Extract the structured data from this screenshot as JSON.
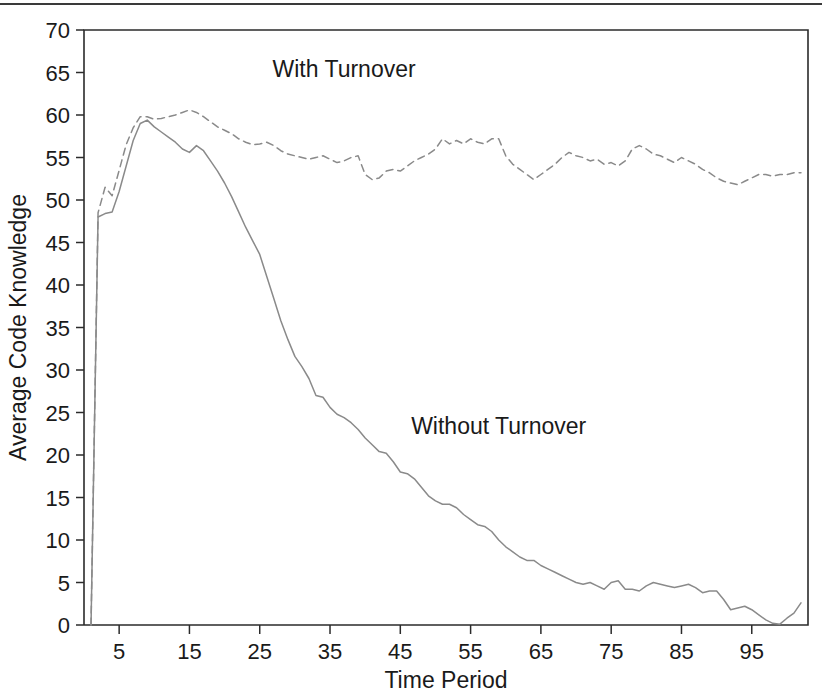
{
  "figure": {
    "top_rule": true,
    "background_color": "#ffffff",
    "line_color": "#8a8a8a",
    "axis_color": "#2b2b2b"
  },
  "chart_data": {
    "type": "line",
    "title": "",
    "xlabel": "Time Period",
    "ylabel": "Average Code Knowledge",
    "xlim": [
      0,
      103
    ],
    "ylim": [
      0,
      70
    ],
    "grid": false,
    "legend": "inline-annotations",
    "x_ticks": [
      5,
      15,
      25,
      35,
      45,
      55,
      65,
      75,
      85,
      95
    ],
    "y_ticks": [
      0,
      5,
      10,
      15,
      20,
      25,
      30,
      35,
      40,
      45,
      50,
      55,
      60,
      65,
      70
    ],
    "annotations": [
      {
        "text": "With Turnover",
        "x": 37,
        "y": 64.5
      },
      {
        "text": "Without Turnover",
        "x": 59,
        "y": 22.5
      }
    ],
    "x": [
      1,
      2,
      3,
      4,
      5,
      6,
      7,
      8,
      9,
      10,
      11,
      12,
      13,
      14,
      15,
      16,
      17,
      18,
      19,
      20,
      21,
      22,
      23,
      24,
      25,
      26,
      27,
      28,
      29,
      30,
      31,
      32,
      33,
      34,
      35,
      36,
      37,
      38,
      39,
      40,
      41,
      42,
      43,
      44,
      45,
      46,
      47,
      48,
      49,
      50,
      51,
      52,
      53,
      54,
      55,
      56,
      57,
      58,
      59,
      60,
      61,
      62,
      63,
      64,
      65,
      66,
      67,
      68,
      69,
      70,
      71,
      72,
      73,
      74,
      75,
      76,
      77,
      78,
      79,
      80,
      81,
      82,
      83,
      84,
      85,
      86,
      87,
      88,
      89,
      90,
      91,
      92,
      93,
      94,
      95,
      96,
      97,
      98,
      99,
      100,
      101,
      102
    ],
    "series": [
      {
        "name": "With Turnover",
        "style": "dashed",
        "color": "#8a8a8a",
        "values": [
          0,
          48.5,
          51.5,
          50.5,
          53.5,
          56.5,
          58.5,
          59.8,
          59.8,
          59.5,
          59.6,
          59.8,
          60.0,
          60.3,
          60.6,
          60.3,
          59.8,
          59.2,
          58.6,
          58.2,
          57.8,
          57.2,
          56.8,
          56.5,
          56.6,
          56.8,
          56.4,
          55.8,
          55.4,
          55.2,
          55.0,
          54.8,
          55.0,
          55.2,
          54.8,
          54.4,
          54.6,
          55.0,
          55.2,
          53.0,
          52.4,
          52.6,
          53.4,
          53.6,
          53.4,
          54.0,
          54.6,
          55.0,
          55.4,
          56.0,
          57.2,
          56.6,
          57.0,
          56.6,
          57.2,
          56.8,
          56.6,
          57.2,
          57.2,
          55.2,
          54.2,
          53.6,
          53.0,
          52.4,
          53.0,
          53.6,
          54.2,
          55.0,
          55.6,
          55.2,
          55.0,
          54.6,
          54.8,
          54.2,
          54.4,
          54.0,
          54.6,
          56.0,
          56.4,
          56.0,
          55.4,
          55.2,
          54.8,
          54.4,
          55.0,
          54.6,
          54.2,
          53.6,
          53.2,
          52.6,
          52.2,
          52.0,
          51.8,
          52.2,
          52.6,
          53.0,
          53.0,
          52.8,
          53.0,
          53.0,
          53.2,
          53.2
        ]
      },
      {
        "name": "Without Turnover",
        "style": "solid",
        "color": "#8a8a8a",
        "values": [
          0,
          48.0,
          48.4,
          48.6,
          51.0,
          54.0,
          57.0,
          59.0,
          59.4,
          58.6,
          58.0,
          57.4,
          56.8,
          56.0,
          55.6,
          56.4,
          55.8,
          54.6,
          53.4,
          52.0,
          50.4,
          48.6,
          46.8,
          45.2,
          43.6,
          41.0,
          38.4,
          35.8,
          33.6,
          31.6,
          30.4,
          29.0,
          27.0,
          26.8,
          25.6,
          24.8,
          24.4,
          23.8,
          23.0,
          22.0,
          21.2,
          20.4,
          20.2,
          19.2,
          18.0,
          17.8,
          17.2,
          16.2,
          15.2,
          14.6,
          14.2,
          14.2,
          13.8,
          13.0,
          12.4,
          11.8,
          11.6,
          11.0,
          10.0,
          9.2,
          8.6,
          8.0,
          7.6,
          7.6,
          7.0,
          6.6,
          6.2,
          5.8,
          5.4,
          5.0,
          4.8,
          5.0,
          4.6,
          4.2,
          5.0,
          5.2,
          4.2,
          4.2,
          4.0,
          4.6,
          5.0,
          4.8,
          4.6,
          4.4,
          4.6,
          4.8,
          4.4,
          3.8,
          4.0,
          4.0,
          3.0,
          1.8,
          2.0,
          2.2,
          1.8,
          1.2,
          0.6,
          0.2,
          0.1,
          0.8,
          1.4,
          2.6
        ]
      }
    ]
  }
}
